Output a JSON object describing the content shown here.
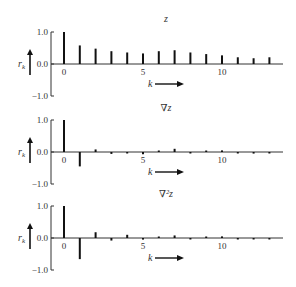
{
  "chart_data": [
    {
      "type": "bar",
      "title": "z",
      "xlabel": "k",
      "ylabel": "r_k",
      "ylim": [
        -1.0,
        1.0
      ],
      "yticks": [
        "1.0",
        "0.0",
        "-1.0"
      ],
      "xticks": [
        "0",
        "5",
        "10"
      ],
      "x": [
        0,
        1,
        2,
        3,
        4,
        5,
        6,
        7,
        8,
        9,
        10,
        11,
        12,
        13
      ],
      "values": [
        1.0,
        0.58,
        0.48,
        0.4,
        0.36,
        0.33,
        0.4,
        0.43,
        0.36,
        0.31,
        0.27,
        0.21,
        0.18,
        0.21
      ]
    },
    {
      "type": "bar",
      "title": "∇z",
      "xlabel": "k",
      "ylabel": "r_k",
      "ylim": [
        -1.0,
        1.0
      ],
      "yticks": [
        "1.0",
        "0.0",
        "-1.0"
      ],
      "xticks": [
        "0",
        "5",
        "10"
      ],
      "x": [
        0,
        1,
        2,
        3,
        4,
        5,
        6,
        7,
        8,
        9,
        10,
        11,
        12,
        13
      ],
      "values": [
        1.0,
        -0.45,
        0.08,
        -0.06,
        -0.04,
        -0.07,
        0.04,
        0.1,
        -0.03,
        0.03,
        0.05,
        -0.03,
        -0.05,
        -0.04
      ]
    },
    {
      "type": "bar",
      "title": "∇²z",
      "xlabel": "k",
      "ylabel": "r_k",
      "ylim": [
        -1.0,
        1.0
      ],
      "yticks": [
        "1.0",
        "0.0",
        "-1.0"
      ],
      "xticks": [
        "0",
        "5",
        "10"
      ],
      "x": [
        0,
        1,
        2,
        3,
        4,
        5,
        6,
        7,
        8,
        9,
        10,
        11,
        12,
        13
      ],
      "values": [
        1.0,
        -0.66,
        0.18,
        -0.08,
        0.1,
        -0.05,
        0.0,
        0.08,
        -0.03,
        0.03,
        0.05,
        -0.02,
        -0.03,
        -0.04
      ]
    }
  ],
  "panels": [
    {
      "title": "z",
      "ylabel_main": "r",
      "ylabel_sub": "k",
      "xlabel": "k",
      "ytick_top": "1.0",
      "ytick_mid": "0.0",
      "ytick_bot": "−1.0",
      "xtick0": "0",
      "xtick5": "5",
      "xtick10": "10"
    },
    {
      "title": "∇z",
      "ylabel_main": "r",
      "ylabel_sub": "k",
      "xlabel": "k",
      "ytick_top": "1.0",
      "ytick_mid": "0.0",
      "ytick_bot": "−1.0",
      "xtick0": "0",
      "xtick5": "5",
      "xtick10": "10"
    },
    {
      "title": "∇²z",
      "ylabel_main": "r",
      "ylabel_sub": "k",
      "xlabel": "k",
      "ytick_top": "1.0",
      "ytick_mid": "0.0",
      "ytick_bot": "−1.0",
      "xtick0": "0",
      "xtick5": "5",
      "xtick10": "10"
    }
  ]
}
